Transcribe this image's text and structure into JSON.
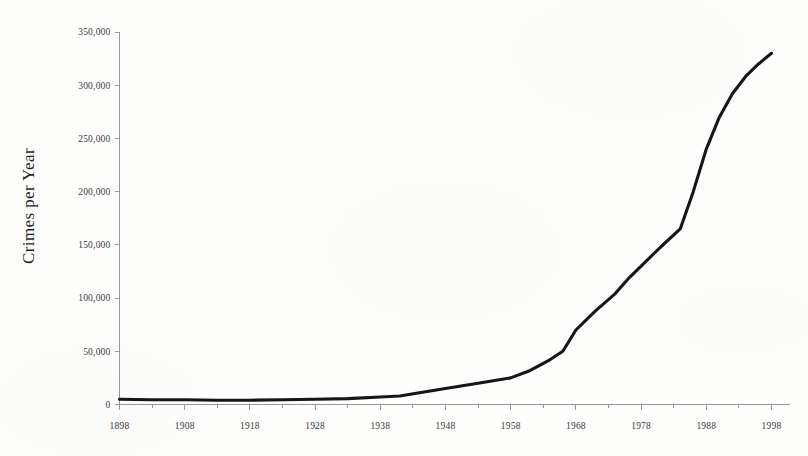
{
  "chart_data": {
    "type": "line",
    "title": "",
    "xlabel": "",
    "ylabel": "Crimes per Year",
    "xlim": [
      1898,
      1998
    ],
    "ylim": [
      0,
      350000
    ],
    "grid": false,
    "legend": null,
    "y_ticks": [
      0,
      50000,
      100000,
      150000,
      200000,
      250000,
      300000,
      350000
    ],
    "y_tick_labels": [
      "0",
      "50,000",
      "100,000",
      "150,000",
      "200,000",
      "250,000",
      "300,000",
      "350,000"
    ],
    "x_ticks": [
      1898,
      1908,
      1918,
      1928,
      1938,
      1948,
      1958,
      1968,
      1978,
      1988,
      1998
    ],
    "x_tick_labels": [
      "1898",
      "1908",
      "1918",
      "1928",
      "1938",
      "1948",
      "1958",
      "1968",
      "1978",
      "1988",
      "1998"
    ],
    "x_minor_tick_interval": 5,
    "line_color": "#16161a",
    "axis_color": "#9a9a9a",
    "series": [
      {
        "name": "Crimes per Year",
        "x": [
          1898,
          1903,
          1908,
          1913,
          1918,
          1923,
          1928,
          1933,
          1938,
          1941,
          1944,
          1948,
          1953,
          1956,
          1958,
          1961,
          1964,
          1966,
          1968,
          1971,
          1974,
          1976,
          1978,
          1981,
          1984,
          1986,
          1988,
          1990,
          1992,
          1994,
          1996,
          1998
        ],
        "values": [
          5000,
          4500,
          4500,
          4000,
          4000,
          4500,
          5000,
          5500,
          7000,
          8000,
          11000,
          15000,
          20000,
          23000,
          25000,
          32000,
          42000,
          50000,
          70000,
          88000,
          104000,
          118000,
          130000,
          148000,
          165000,
          200000,
          240000,
          270000,
          292000,
          308000,
          320000,
          330000
        ]
      }
    ]
  },
  "axes": {
    "y_title": "Crimes per Year"
  }
}
